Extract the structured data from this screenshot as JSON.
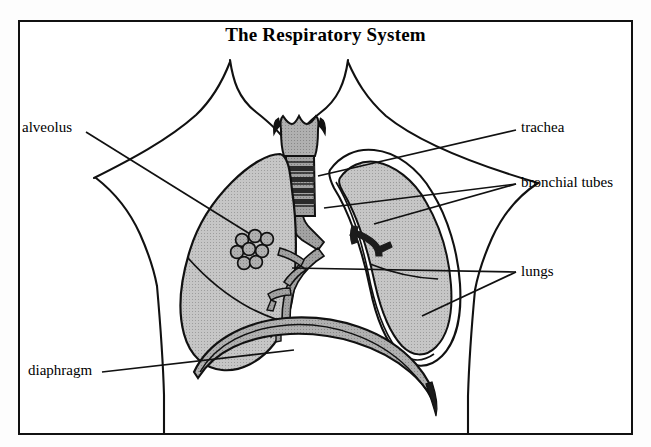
{
  "diagram": {
    "title": "The Respiratory System",
    "type": "anatomical-illustration",
    "style": "black-and-white line drawing with gray shading",
    "frame": {
      "border_color": "#111111",
      "background": "#ffffff"
    },
    "colors": {
      "outline": "#111111",
      "lung_fill": "#b9b9b9",
      "trachea_fill": "#a8a8a8",
      "bronchi_fill": "#8f8f8f",
      "diaphragm_fill": "#a3a3a3",
      "pleura_fill": "#ffffff",
      "label_text": "#000000"
    },
    "labels": [
      {
        "id": "alveolus",
        "text": "alveolus",
        "side": "left",
        "target": "alveoli cluster in left lung"
      },
      {
        "id": "diaphragm",
        "text": "diaphragm",
        "side": "left",
        "target": "diaphragm dome"
      },
      {
        "id": "trachea",
        "text": "trachea",
        "side": "right",
        "target": "trachea (windpipe)"
      },
      {
        "id": "bronchial-tubes",
        "text": "bronchial tubes",
        "side": "right",
        "target": "bronchi in both lungs"
      },
      {
        "id": "lungs",
        "text": "lungs",
        "side": "right",
        "target": "left and right lung"
      }
    ],
    "structures": [
      "neck and shoulders outline",
      "larynx",
      "trachea with cartilage rings",
      "left lung (shaded)",
      "right lung with pleural membrane",
      "bronchial tree",
      "alveoli cluster",
      "diaphragm"
    ]
  }
}
